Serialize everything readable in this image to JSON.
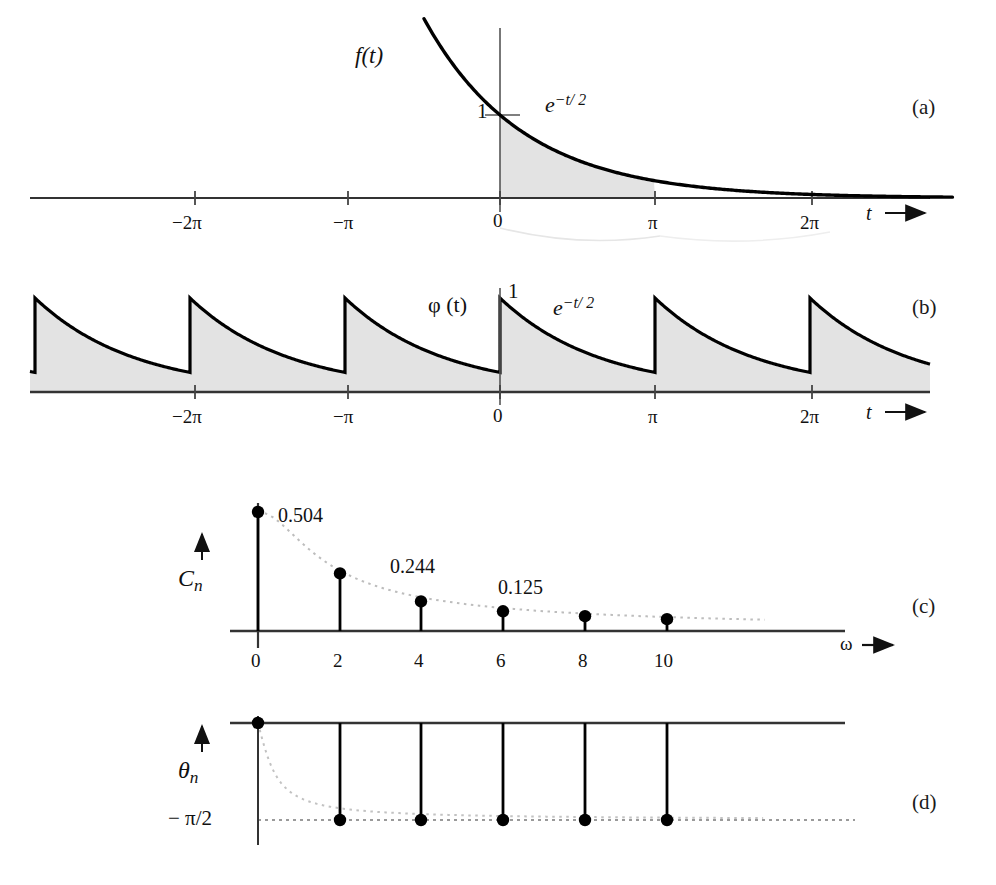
{
  "figure": {
    "panels": [
      {
        "id": "a",
        "letter": "(a)"
      },
      {
        "id": "b",
        "letter": "(b)"
      },
      {
        "id": "c",
        "letter": "(c)"
      },
      {
        "id": "d",
        "letter": "(d)"
      }
    ]
  },
  "panel_a": {
    "function_label": "f(t)",
    "curve_label_base": "e",
    "curve_label_exp": "−t/ 2",
    "y_tick_label": "1",
    "axis_label": "t",
    "axis_arrow": "➜",
    "ticks": [
      "−2π",
      "−π",
      "0",
      "π",
      "2π"
    ]
  },
  "panel_b": {
    "function_label": "φ (t)",
    "curve_label_base": "e",
    "curve_label_exp": "−t/ 2",
    "peak_label": "1",
    "axis_label": "t",
    "axis_arrow": "➜",
    "ticks": [
      "−2π",
      "−π",
      "0",
      "π",
      "2π"
    ]
  },
  "panel_c": {
    "y_axis_label_base": "C",
    "y_axis_label_sub": "n",
    "x_axis_label": "ω",
    "x_axis_arrow": "➜",
    "ticks": [
      "0",
      "2",
      "4",
      "6",
      "8",
      "10"
    ],
    "value_labels": [
      "0.504",
      "0.244",
      "0.125"
    ]
  },
  "panel_d": {
    "y_axis_label_base": "θ",
    "y_axis_label_sub": "n",
    "x_axis_label": "ω",
    "x_axis_arrow": "➜",
    "asymptote_label": "− π/2",
    "ticks": [
      "0",
      "2",
      "4",
      "6",
      "8",
      "10"
    ]
  },
  "colors": {
    "ink": "#111111",
    "curve": "#000000",
    "fill": "#e3e3e3",
    "axis": "#333333",
    "dotted": "#b8b8b8"
  },
  "chart_data": [
    {
      "type": "line",
      "panel": "a",
      "title": "f(t) = e^(-t/2) decaying exponential",
      "xlabel": "t",
      "ylabel": "f(t)",
      "annotations": [
        "e^{-t/2}",
        "1"
      ],
      "xticks": [
        -6.283,
        -3.1416,
        0,
        3.1416,
        6.283
      ],
      "xticklabels": [
        "-2π",
        "-π",
        "0",
        "π",
        "2π"
      ],
      "shaded_region": [
        0,
        3.1416
      ],
      "y_at_zero": 1,
      "decay_rate": 0.5,
      "grid": false
    },
    {
      "type": "line",
      "panel": "b",
      "title": "φ(t) periodic extension of e^(-t/2), period π",
      "xlabel": "t",
      "ylabel": "φ (t)",
      "annotations": [
        "e^{-t/2}",
        "1"
      ],
      "xticks": [
        -6.283,
        -3.1416,
        0,
        3.1416,
        6.283
      ],
      "xticklabels": [
        "-2π",
        "-π",
        "0",
        "π",
        "2π"
      ],
      "period": 3.1416,
      "peak_value": 1,
      "decay_rate": 0.5,
      "filled": true,
      "grid": false
    },
    {
      "type": "bar",
      "panel": "c",
      "title": "Amplitude spectrum C_n",
      "xlabel": "ω",
      "ylabel": "C_n",
      "categories": [
        "0",
        "2",
        "4",
        "6",
        "8",
        "10"
      ],
      "x": [
        0,
        2,
        4,
        6,
        8,
        10
      ],
      "values": [
        0.504,
        0.244,
        0.125,
        0.0835,
        0.0627,
        0.0502
      ],
      "labeled_values": [
        0.504,
        0.244,
        0.125
      ],
      "envelope": "dotted decaying curve through stem tips",
      "ylim": [
        0,
        0.56
      ],
      "grid": false,
      "stem": true
    },
    {
      "type": "bar",
      "panel": "d",
      "title": "Phase spectrum θ_n",
      "xlabel": "ω",
      "ylabel": "θ_n",
      "categories": [
        "0",
        "2",
        "4",
        "6",
        "8",
        "10"
      ],
      "x": [
        0,
        2,
        4,
        6,
        8,
        10
      ],
      "values": [
        0,
        -1.5708,
        -1.5708,
        -1.5708,
        -1.5708,
        -1.5708
      ],
      "asymptote": -1.5708,
      "asymptote_label": "-π/2",
      "ylim": [
        -1.75,
        0.1
      ],
      "grid": false,
      "stem": true
    }
  ]
}
